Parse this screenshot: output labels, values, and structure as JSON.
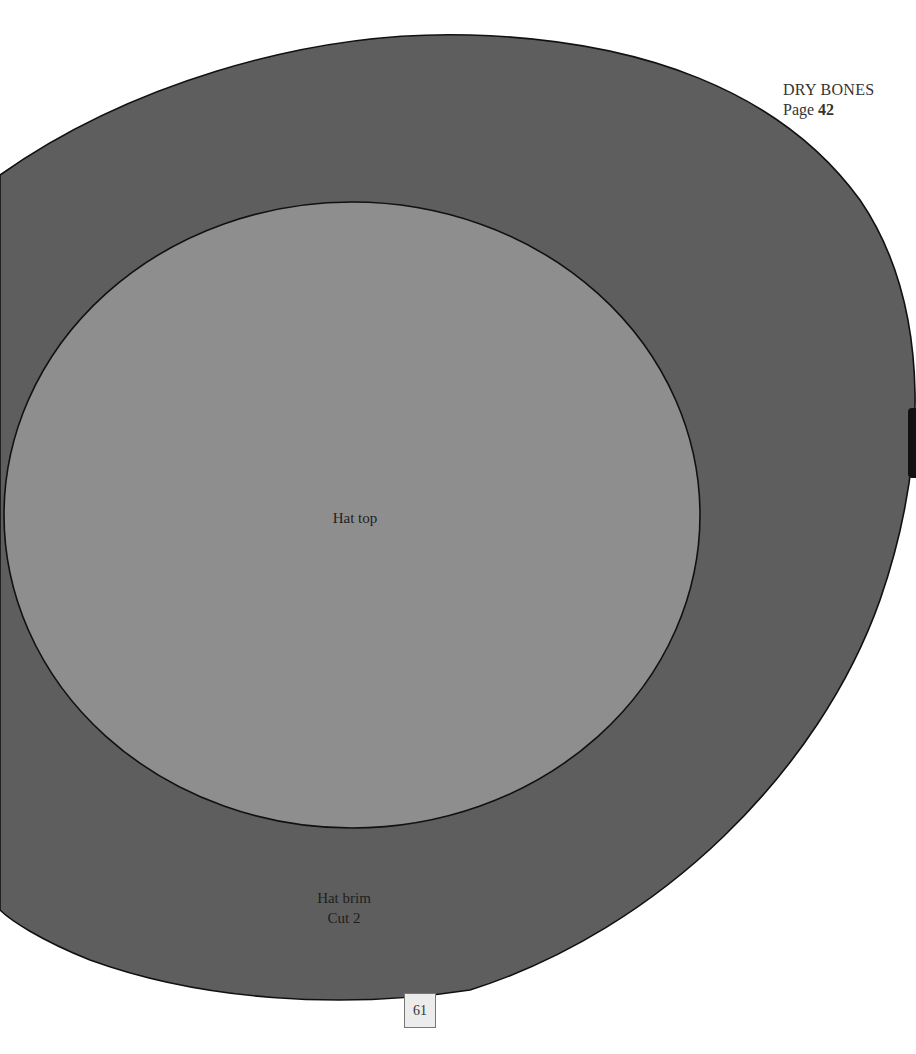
{
  "header": {
    "title": "DRY BONES",
    "page_prefix": "Page",
    "page_number": "42"
  },
  "pattern": {
    "outer_piece": {
      "name": "Hat brim",
      "instruction": "Cut 2",
      "fill_color": "#5e5e5e",
      "outline_color": "#111111"
    },
    "inner_piece": {
      "name": "Hat top",
      "fill_color": "#8e8e8e",
      "outline_color": "#111111"
    }
  },
  "footer": {
    "page_number": "61"
  }
}
